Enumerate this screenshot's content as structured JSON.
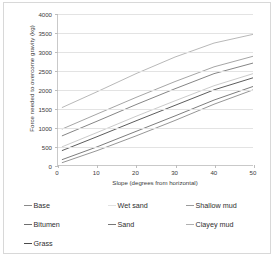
{
  "figure": {
    "border_color": "#d8d8d8",
    "background": "#ffffff"
  },
  "chart_data": {
    "type": "line",
    "title": "",
    "xlabel": "Slope (degrees from horizontal)",
    "ylabel": "Force needed  to overcome gravity (kg)",
    "xlim": [
      0,
      50
    ],
    "ylim": [
      0,
      4000
    ],
    "xticks": [
      0,
      10,
      20,
      30,
      40,
      50
    ],
    "yticks": [
      0,
      500,
      1000,
      1500,
      2000,
      2500,
      3000,
      3500,
      4000
    ],
    "xtick_labels": [
      "0",
      "10",
      "20",
      "30",
      "40",
      "50"
    ],
    "ytick_labels": [
      "0",
      "500",
      "1000",
      "1500",
      "2000",
      "2500",
      "3000",
      "3500",
      "4000"
    ],
    "grid": "horizontal",
    "legend_position": "below",
    "x": [
      1,
      10,
      20,
      30,
      40,
      50
    ],
    "series": [
      {
        "name": "Base",
        "color": "#8a8a8a",
        "values": [
          60,
          380,
          770,
          1180,
          1610,
          1990
        ]
      },
      {
        "name": "Bitumen",
        "color": "#6e6e6e",
        "values": [
          140,
          480,
          890,
          1300,
          1720,
          2080
        ]
      },
      {
        "name": "Grass",
        "color": "#4a4a4a",
        "values": [
          380,
          750,
          1170,
          1580,
          1990,
          2310
        ]
      },
      {
        "name": "Wet sand",
        "color": "#c4c4c4",
        "values": [
          480,
          860,
          1290,
          1700,
          2100,
          2420
        ]
      },
      {
        "name": "Sand",
        "color": "#777777",
        "values": [
          770,
          1160,
          1600,
          2020,
          2420,
          2700
        ]
      },
      {
        "name": "Shallow mud",
        "color": "#9b9b9b",
        "values": [
          950,
          1350,
          1790,
          2210,
          2600,
          2880
        ]
      },
      {
        "name": "Clayey mud",
        "color": "#b0b0b0",
        "values": [
          1520,
          1940,
          2420,
          2860,
          3230,
          3460
        ]
      }
    ]
  },
  "legend": {
    "items": [
      {
        "label": "Base",
        "color": "#8a8a8a",
        "col": 0,
        "row": 0
      },
      {
        "label": "Wet sand",
        "color": "#e2e2e2",
        "col": 1,
        "row": 0
      },
      {
        "label": "Shallow mud",
        "color": "#9b9b9b",
        "col": 2,
        "row": 0
      },
      {
        "label": "Bitumen",
        "color": "#6e6e6e",
        "col": 0,
        "row": 1
      },
      {
        "label": "Sand",
        "color": "#777777",
        "col": 1,
        "row": 1
      },
      {
        "label": "Clayey mud",
        "color": "#b0b0b0",
        "col": 2,
        "row": 1
      },
      {
        "label": "Grass",
        "color": "#4a4a4a",
        "col": 0,
        "row": 2
      }
    ]
  }
}
